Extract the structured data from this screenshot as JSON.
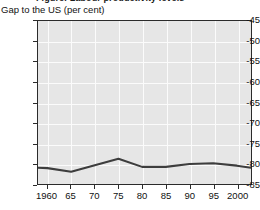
{
  "figure": {
    "clipped_title": "Figure: Labour productivity levels",
    "axis_title": "Gap to the US (per cent)"
  },
  "chart_data": {
    "type": "line",
    "title": "Gap to the US (per cent)",
    "xlabel": "",
    "ylabel": "Gap to the US (per cent)",
    "xlim": [
      1958,
      2003
    ],
    "ylim": [
      -85,
      -45
    ],
    "grid": true,
    "legend": "none",
    "x_tick_values": [
      1960,
      1965,
      1970,
      1975,
      1980,
      1985,
      1990,
      1995,
      2000
    ],
    "x_tick_labels": [
      "1960",
      "65",
      "70",
      "75",
      "80",
      "85",
      "90",
      "95",
      "2000"
    ],
    "y_tick_values": [
      -45,
      -50,
      -55,
      -60,
      -65,
      -70,
      -75,
      -80,
      -85
    ],
    "y_tick_labels": [
      "-45",
      "-50",
      "-55",
      "-60",
      "-65",
      "-70",
      "-75",
      "-80",
      "-85"
    ],
    "series": [
      {
        "name": "Gap to the US",
        "color": "#3d3d3d",
        "x": [
          1958,
          1960,
          1965,
          1970,
          1975,
          1980,
          1985,
          1990,
          1995,
          2000,
          2003
        ],
        "values": [
          -81.0,
          -81.1,
          -82.0,
          -80.4,
          -78.8,
          -80.8,
          -80.8,
          -80.1,
          -79.9,
          -80.5,
          -81.0
        ]
      }
    ]
  },
  "colors": {
    "plot_background": "#e6e6e6",
    "gridline": "#fbfbfb",
    "axis": "#2b2b2b",
    "series_line": "#3d3d3d",
    "text": "#111111"
  }
}
